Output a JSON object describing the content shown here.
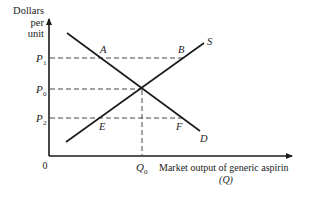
{
  "diagram": {
    "type": "supply-demand",
    "y_axis_label": [
      "Dollars",
      "per",
      "unit"
    ],
    "x_axis_label": "Market output of generic aspirin",
    "x_axis_symbol": "(Q)",
    "origin_label": "0",
    "price_labels": [
      {
        "id": "p1",
        "main": "P",
        "sub": "1"
      },
      {
        "id": "p0",
        "main": "P",
        "sub": "0"
      },
      {
        "id": "p2",
        "main": "P",
        "sub": "2"
      }
    ],
    "quantity_label": {
      "main": "Q",
      "sub": "0"
    },
    "curves": {
      "supply": "S",
      "demand": "D"
    },
    "points": {
      "A": "A",
      "B": "B",
      "E": "E",
      "F": "F"
    }
  }
}
